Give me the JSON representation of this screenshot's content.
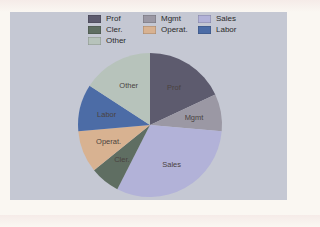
{
  "page": {
    "background": "#faf7f2"
  },
  "panel": {
    "background": "#c5c8d3"
  },
  "chart_data": {
    "type": "pie",
    "title": "",
    "legend_position": "top",
    "legend_columns": 3,
    "slice_labels_shown": true,
    "slices": [
      {
        "label": "Prof",
        "value_pct": 18.1,
        "start_angle": 0,
        "end_angle": 65,
        "color": "#5d5b6e"
      },
      {
        "label": "Mgmt",
        "value_pct": 8.3,
        "start_angle": 65,
        "end_angle": 95,
        "color": "#9b98a4"
      },
      {
        "label": "Sales",
        "value_pct": 31.1,
        "start_angle": 95,
        "end_angle": 207,
        "color": "#b2b2d8"
      },
      {
        "label": "Cler.",
        "value_pct": 6.7,
        "start_angle": 207,
        "end_angle": 231,
        "color": "#5f6e62"
      },
      {
        "label": "Operat.",
        "value_pct": 9.4,
        "start_angle": 231,
        "end_angle": 265,
        "color": "#d8b291"
      },
      {
        "label": "Labor",
        "value_pct": 10.6,
        "start_angle": 265,
        "end_angle": 303,
        "color": "#4c6ca6"
      },
      {
        "label": "Other",
        "value_pct": 15.8,
        "start_angle": 303,
        "end_angle": 360,
        "color": "#b7c3bb"
      }
    ],
    "legend_order": [
      "Prof",
      "Mgmt",
      "Sales",
      "Cler.",
      "Operat.",
      "Labor",
      "Other"
    ]
  }
}
